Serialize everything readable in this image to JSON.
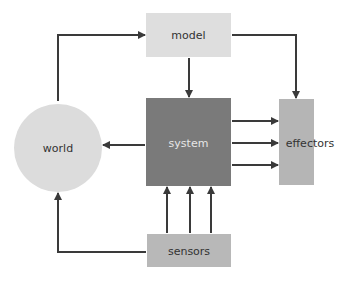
{
  "diagram": {
    "nodes": {
      "model": {
        "label": "model",
        "color": "#dedede",
        "text_color": "#333333"
      },
      "system": {
        "label": "system",
        "color": "#7a7a7a",
        "text_color": "#e6e6e6"
      },
      "effectors": {
        "label": "effectors",
        "color": "#b5b5b5",
        "text_color": "#333333"
      },
      "world": {
        "label": "world",
        "color": "#dcdcdc",
        "text_color": "#333333"
      },
      "sensors": {
        "label": "sensors",
        "color": "#b8b8b8",
        "text_color": "#333333"
      }
    },
    "edges": [
      {
        "from": "world",
        "to": "model"
      },
      {
        "from": "model",
        "to": "system"
      },
      {
        "from": "model",
        "to": "effectors"
      },
      {
        "from": "system",
        "to": "effectors",
        "count": 3
      },
      {
        "from": "system",
        "to": "world"
      },
      {
        "from": "sensors",
        "to": "system",
        "count": 3
      },
      {
        "from": "sensors",
        "to": "world"
      }
    ],
    "arrow_color": "#3a3a3a"
  }
}
